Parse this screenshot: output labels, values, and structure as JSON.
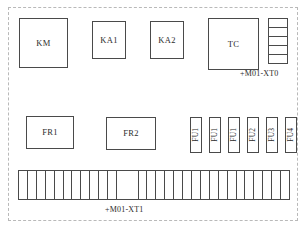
{
  "diagram": {
    "enclosure": {
      "border_style": "dash-dot",
      "color": "#b9b9b9"
    },
    "line_color": "#4a4a4a",
    "text_color": "#2b2b2b",
    "background": "#ffffff"
  },
  "components": {
    "top_row": [
      {
        "label": "KM",
        "name": "contactor-km"
      },
      {
        "label": "KA1",
        "name": "relay-ka1"
      },
      {
        "label": "KA2",
        "name": "relay-ka2"
      },
      {
        "label": "TC",
        "name": "transformer-tc"
      }
    ],
    "middle_row": [
      {
        "label": "FR1",
        "name": "overload-relay-fr1"
      },
      {
        "label": "FR2",
        "name": "overload-relay-fr2"
      }
    ],
    "fuses": [
      {
        "label": "FU1"
      },
      {
        "label": "FU1"
      },
      {
        "label": "FU1"
      },
      {
        "label": "FU2"
      },
      {
        "label": "FU3"
      },
      {
        "label": "FU4"
      }
    ]
  },
  "terminal_blocks": {
    "xt0": {
      "label": "+M01-XT0",
      "orientation": "vertical",
      "cell_count": 5
    },
    "xt1": {
      "label": "+M01-XT1",
      "orientation": "horizontal",
      "cell_count": 29,
      "wide_cell_index": 11
    }
  }
}
